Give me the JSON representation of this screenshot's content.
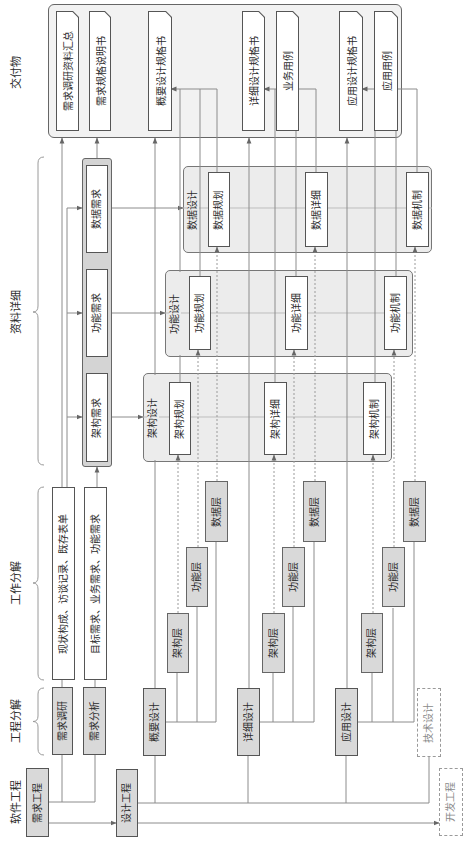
{
  "headers": {
    "software_engineering": "软件工程",
    "engineering_breakdown": "工程分解",
    "work_breakdown": "工作分解",
    "data_detail": "资料详细",
    "deliverables": "交付物"
  },
  "engineering": {
    "requirements": "需求工程",
    "design": "设计工程",
    "development": "开发工程"
  },
  "phases": {
    "requirements_survey": "需求调研",
    "requirements_analysis": "需求分析",
    "overview_design": "概要设计",
    "detailed_design": "详细设计",
    "application_design": "应用设计",
    "technical_design": "技术设计"
  },
  "work_items": {
    "survey_outputs": "现状构成、访谈记录、既存表单",
    "analysis_outputs": "目标需求、业务需求、功能需求"
  },
  "layer_sets": [
    [
      "架构层",
      "功能层",
      "数据层"
    ],
    [
      "架构层",
      "功能层",
      "数据层"
    ],
    [
      "架构层",
      "功能层",
      "数据层"
    ]
  ],
  "requirements_group": {
    "items": [
      "架构需求",
      "功能需求",
      "数据需求"
    ]
  },
  "design_groups": [
    {
      "title": "架构设计",
      "items": [
        "架构规划",
        "架构详细",
        "架构机制"
      ]
    },
    {
      "title": "功能设计",
      "items": [
        "功能规划",
        "功能详细",
        "功能机制"
      ]
    },
    {
      "title": "数据设计",
      "items": [
        "数据规划",
        "数据详细",
        "数据机制"
      ]
    }
  ],
  "deliverables": {
    "items": [
      "需求调研资料汇总",
      "需求规格说明书",
      "概要设计规格书",
      "详细设计规格书",
      "业务用例",
      "应用设计规格书",
      "应用用例"
    ]
  },
  "colors": {
    "gray-fill": "#d9d9d9",
    "border": "#555555",
    "group-fill": "#ececec",
    "req-group-fill": "#d4d4d4",
    "container-fill": "#f2f2f2",
    "line": "#8c8c8c",
    "dashed": "#9a9a9a",
    "text": "#2b2b2b",
    "muted": "#8a8a8a"
  }
}
